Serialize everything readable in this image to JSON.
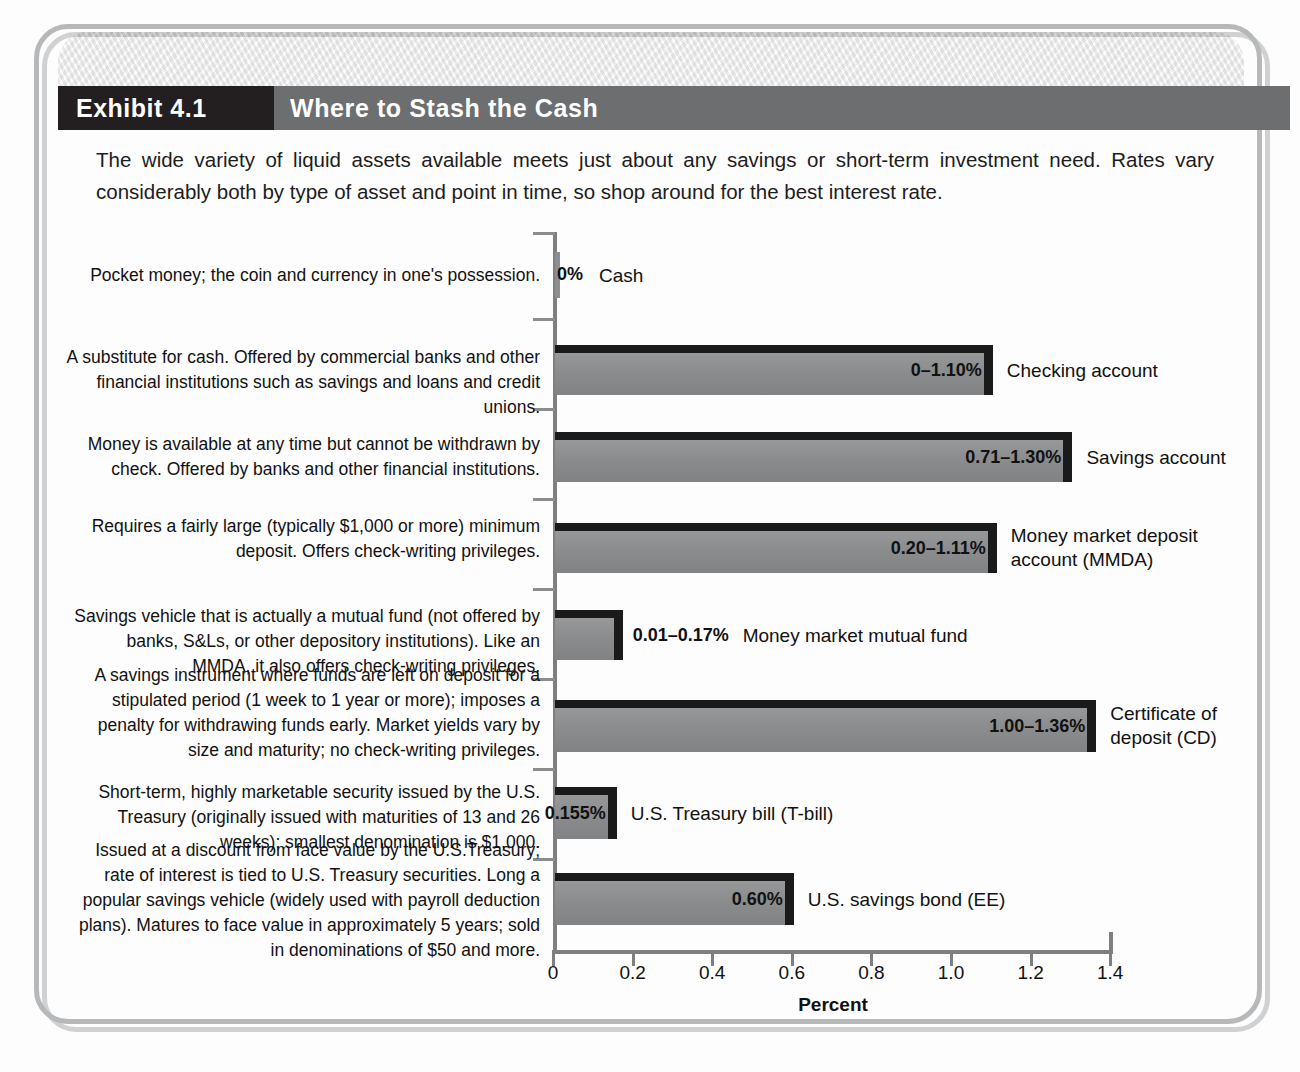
{
  "exhibit": {
    "number_label": "Exhibit 4.1",
    "title": "Where to Stash the Cash",
    "intro": "The wide variety of liquid assets available meets just about any savings or short-term investment need. Rates vary considerably both by type of asset and point in time, so shop around for the best interest rate."
  },
  "colors": {
    "title_black": "#231f20",
    "title_gray": "#6c6e70",
    "bar_fill": "#8c8e90",
    "bar_edge": "#1a1a1a",
    "axis": "#7d7f81",
    "frame": "#b6b8ba"
  },
  "chart_data": {
    "type": "bar",
    "orientation": "horizontal",
    "title": "Where to Stash the Cash",
    "xlabel": "Percent",
    "ylabel": "",
    "xlim": [
      0,
      1.4
    ],
    "xticks": [
      0,
      0.2,
      0.4,
      0.6,
      0.8,
      1.0,
      1.2,
      1.4
    ],
    "xticklabels": [
      "0",
      "0.2",
      "0.4",
      "0.6",
      "0.8",
      "1.0",
      "1.2",
      "1.4"
    ],
    "grid": false,
    "legend": "none",
    "categories": [
      "Cash",
      "Checking account",
      "Savings account",
      "Money market deposit account (MMDA)",
      "Money market mutual fund",
      "Certificate of deposit (CD)",
      "U.S. Treasury bill (T-bill)",
      "U.S. savings bond (EE)"
    ],
    "values": [
      0,
      1.1,
      1.3,
      1.11,
      0.17,
      1.36,
      0.155,
      0.6
    ],
    "value_labels": [
      "0%",
      "0-1.10%",
      "0.71-1.30%",
      "0.20-1.11%",
      "0.01-0.17%",
      "1.00-1.36%",
      "0.155%",
      "0.60%"
    ]
  },
  "rows": [
    {
      "description": "Pocket money; the coin and currency in one's possession.",
      "label": "Cash",
      "value_label": "0%",
      "value": 0,
      "label_inside": false
    },
    {
      "description": "A substitute for cash. Offered by commercial banks and other financial institutions such as savings and loans and credit unions.",
      "label": "Checking account",
      "value_label": "0–1.10%",
      "value": 1.1,
      "label_inside": true
    },
    {
      "description": "Money is available at any time but cannot be withdrawn by check. Offered by banks and other financial institutions.",
      "label": "Savings account",
      "value_label": "0.71–1.30%",
      "value": 1.3,
      "label_inside": true
    },
    {
      "description": "Requires a fairly large (typically $1,000 or more) minimum deposit. Offers check-writing privileges.",
      "label": "Money market deposit\naccount (MMDA)",
      "value_label": "0.20–1.11%",
      "value": 1.11,
      "label_inside": true
    },
    {
      "description": "Savings vehicle that is actually a mutual fund (not offered by banks, S&Ls, or other depository institutions). Like an MMDA, it also offers check-writing privileges.",
      "label": "Money market mutual fund",
      "value_label": "0.01–0.17%",
      "value": 0.17,
      "label_inside": false
    },
    {
      "description": "A savings instrument where funds are left on deposit for a stipulated period (1 week to 1 year or more); imposes a penalty for withdrawing funds early. Market yields vary by size and maturity; no check-writing privileges.",
      "label": "Certificate of\ndeposit (CD)",
      "value_label": "1.00–1.36%",
      "value": 1.36,
      "label_inside": true
    },
    {
      "description": "Short-term, highly marketable security issued by the U.S. Treasury (originally issued with maturities of 13 and 26 weeks); smallest denomination is $1,000.",
      "label": "U.S. Treasury bill (T-bill)",
      "value_label": "0.155%",
      "value": 0.155,
      "label_inside": true
    },
    {
      "description": "Issued at a discount from face value by the U.S.Treasury; rate of interest is tied to U.S. Treasury securities. Long a popular savings vehicle (widely used with payroll deduction plans). Matures to face value in approximately 5 years; sold in denominations of $50 and more.",
      "label": "U.S. savings bond (EE)",
      "value_label": "0.60%",
      "value": 0.6,
      "label_inside": true
    }
  ]
}
